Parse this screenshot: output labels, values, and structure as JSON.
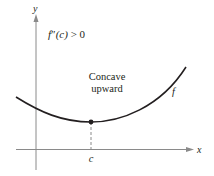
{
  "diagram": {
    "title": "Concave upward",
    "axes": {
      "x_label": "x",
      "y_label": "y"
    },
    "condition": {
      "func": "f",
      "primes": "″",
      "arg": "(c)",
      "relation": " > 0"
    },
    "annotation": {
      "line1": "Concave",
      "line2": "upward"
    },
    "curve_label": "f",
    "point_label": "c",
    "colors": {
      "axis": "#8a8a8a",
      "curve": "#231f20",
      "text": "#231f20",
      "background": "#ffffff"
    }
  }
}
